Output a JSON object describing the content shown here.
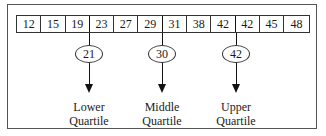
{
  "diagram": {
    "type": "quartiles",
    "values": [
      "12",
      "15",
      "19",
      "23",
      "27",
      "29",
      "31",
      "38",
      "42",
      "42",
      "45",
      "48"
    ],
    "quartiles": [
      {
        "value": "21",
        "label_line1": "Lower",
        "label_line2": "Quartile",
        "between_index": 2
      },
      {
        "value": "30",
        "label_line1": "Middle",
        "label_line2": "Quartile",
        "between_index": 5
      },
      {
        "value": "42",
        "label_line1": "Upper",
        "label_line2": "Quartile",
        "between_index": 8
      }
    ]
  }
}
